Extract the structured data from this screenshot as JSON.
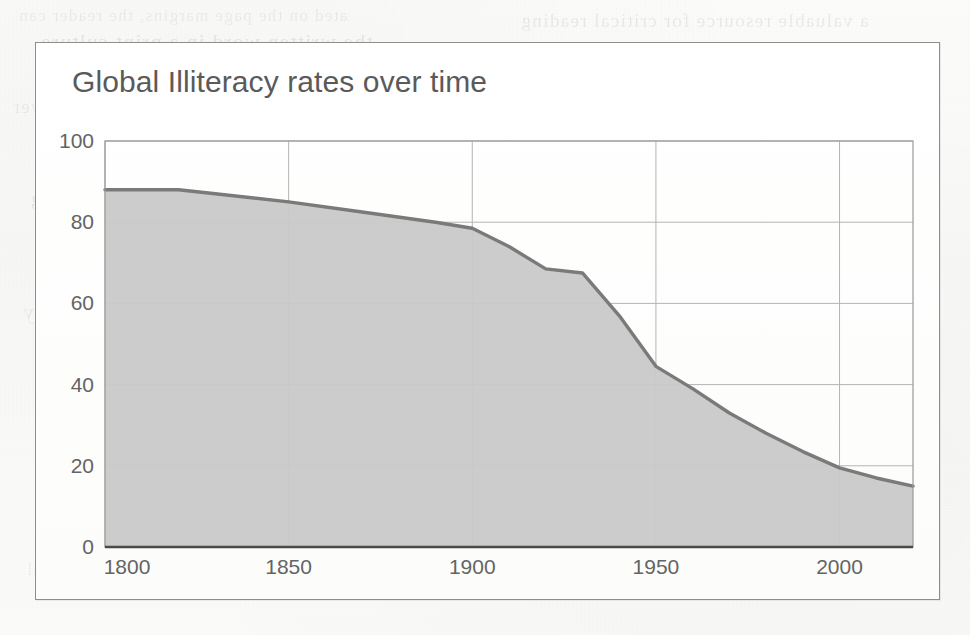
{
  "card": {
    "title": "Global Illiteracy rates over time"
  },
  "chart_data": {
    "type": "area",
    "title": "Global Illiteracy rates over time",
    "xlabel": "",
    "ylabel": "",
    "xlim": [
      1800,
      2020
    ],
    "ylim": [
      0,
      100
    ],
    "grid": true,
    "legend": false,
    "legend_position": "none",
    "x_ticks": [
      "1800",
      "1850",
      "1900",
      "1950",
      "2000"
    ],
    "x_tick_values": [
      1800,
      1850,
      1900,
      1950,
      2000
    ],
    "y_ticks": [
      "0",
      "20",
      "40",
      "60",
      "80",
      "100"
    ],
    "y_tick_values": [
      0,
      20,
      40,
      60,
      80,
      100
    ],
    "series": [
      {
        "name": "Global illiteracy rate",
        "line_color": "#7a7a7a",
        "fill_color": "#c9c9c9",
        "x": [
          1800,
          1820,
          1830,
          1850,
          1870,
          1890,
          1900,
          1910,
          1920,
          1930,
          1940,
          1950,
          1960,
          1970,
          1980,
          1990,
          2000,
          2010,
          2020
        ],
        "values": [
          88,
          88,
          87,
          85,
          82.5,
          80,
          78.5,
          74,
          68.5,
          67.5,
          57,
          44.5,
          39,
          33,
          28,
          23.5,
          19.5,
          17,
          15
        ]
      }
    ]
  },
  "background": {
    "ghost_text_lines": [
      "ated on the page margins, the reader can",
      "a valuable resource for critical reading",
      "the written word in a print culture",
      "in the early modern period was a",
      "the development of literacy over",
      "education was not universal",
      "access to books and reading",
      "technology of writing changed",
      "a dramatic shift in the way",
      "the printing press made books",
      "and the spread of literacy",
      "it is not surprising that",
      "the diagram and visual"
    ]
  }
}
